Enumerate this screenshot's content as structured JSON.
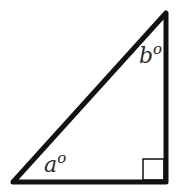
{
  "diagram": {
    "type": "right-triangle",
    "vertices": {
      "bottom_left": [
        13,
        182
      ],
      "top_right": [
        166,
        13
      ],
      "bottom_right": [
        166,
        182
      ]
    },
    "right_angle_at": "bottom_right",
    "labels": {
      "angle_a": {
        "letter": "a",
        "degree_symbol": "o"
      },
      "angle_b": {
        "letter": "b",
        "degree_symbol": "o"
      }
    },
    "colors": {
      "stroke": "#111111",
      "background": "#ffffff"
    }
  }
}
